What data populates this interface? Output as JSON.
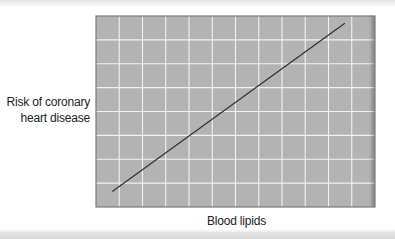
{
  "chart_data": {
    "type": "line",
    "title": "",
    "xlabel": "Blood lipids",
    "ylabel": "Risk of coronary heart disease",
    "ylabel_lines": [
      "Risk of coronary",
      "heart disease"
    ],
    "xlim": [
      0,
      12
    ],
    "ylim": [
      0,
      8
    ],
    "grid": true,
    "legend": null,
    "x_ticks": [],
    "y_ticks": [],
    "series": [
      {
        "name": "Risk vs blood lipids",
        "x": [
          0.7,
          10.7
        ],
        "y": [
          0.65,
          7.7
        ],
        "color": "#333333"
      }
    ],
    "annotations": []
  },
  "colors": {
    "plot_fill": "#b3b3b3",
    "gridline": "#f2f2f2",
    "axis_border": "#7a7a7a",
    "line": "#333333",
    "text": "#222222"
  },
  "layout": {
    "plot_left": 96,
    "plot_top": 16,
    "plot_width": 279,
    "plot_height": 191,
    "grid_cols": 12,
    "grid_rows": 8
  }
}
